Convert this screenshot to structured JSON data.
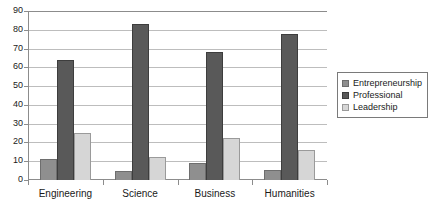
{
  "chart_data": {
    "type": "bar",
    "title": "",
    "subtitle": "",
    "xlabel": "",
    "ylabel": "",
    "categories": [
      "Engineering",
      "Science",
      "Business",
      "Humanities"
    ],
    "series": [
      {
        "name": "Entrepreneurship",
        "color": "#8f8f8f",
        "values": [
          11,
          5,
          9,
          5.5
        ]
      },
      {
        "name": "Professional",
        "color": "#595959",
        "values": [
          64,
          83,
          68,
          78
        ]
      },
      {
        "name": "Leadership",
        "color": "#d6d6d6",
        "values": [
          25,
          12.5,
          22.5,
          16
        ]
      }
    ],
    "ylim": [
      0,
      90
    ],
    "y_ticks": [
      0,
      10,
      20,
      30,
      40,
      50,
      60,
      70,
      80,
      90
    ],
    "y_tick_labels": [
      "0",
      "10",
      "20",
      "30",
      "40",
      "50",
      "60",
      "70",
      "80",
      "90"
    ],
    "grid": true,
    "grid_axis": "y",
    "legend_position": "right",
    "legend_border": true,
    "bar_border_color": "#6e6e6e",
    "axis_color": "#8c8c8c",
    "gridline_color": "#bdbdbd",
    "background": "#ffffff"
  }
}
